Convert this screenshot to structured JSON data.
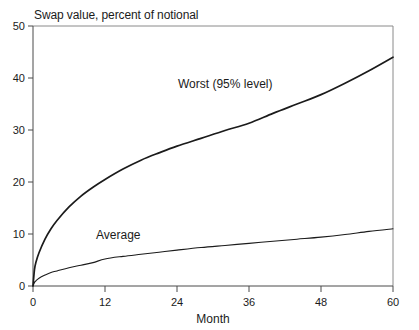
{
  "chart_data": {
    "type": "line",
    "title": "Swap value, percent of notional",
    "xlabel": "Month",
    "ylabel": "",
    "xlim": [
      0,
      60
    ],
    "ylim": [
      0,
      50
    ],
    "grid": false,
    "legend_position": "inline-annotations",
    "xticks": [
      "0",
      "12",
      "24",
      "36",
      "48",
      "60"
    ],
    "xtick_values": [
      0,
      12,
      24,
      36,
      48,
      60
    ],
    "yticks": [
      "0",
      "10",
      "20",
      "30",
      "40",
      "50"
    ],
    "ytick_values": [
      0,
      10,
      20,
      30,
      40,
      50
    ],
    "x": [
      0,
      0.25,
      0.5,
      1,
      2,
      3,
      4,
      6,
      8,
      10,
      12,
      15,
      18,
      21,
      24,
      28,
      32,
      36,
      40,
      44,
      48,
      52,
      56,
      60
    ],
    "series": [
      {
        "name": "Worst (95% level)",
        "label": "Worst (95% level)",
        "color": "#1b1b1b",
        "values": [
          0,
          3.2,
          4.6,
          6.4,
          9.0,
          11.0,
          12.6,
          15.2,
          17.3,
          19.0,
          20.5,
          22.5,
          24.2,
          25.6,
          26.9,
          28.4,
          29.9,
          31.3,
          33.2,
          35.0,
          36.8,
          39.0,
          41.4,
          44.0
        ]
      },
      {
        "name": "Average",
        "label": "Average",
        "color": "#1b1b1b",
        "values": [
          0,
          0.7,
          1.0,
          1.5,
          2.1,
          2.6,
          2.9,
          3.5,
          4.0,
          4.5,
          5.2,
          5.7,
          6.1,
          6.5,
          6.9,
          7.4,
          7.8,
          8.2,
          8.6,
          9.0,
          9.4,
          9.9,
          10.5,
          11.0
        ]
      }
    ],
    "annotations": [
      {
        "text": "Worst (95% level)",
        "x_px": 178,
        "y_px": 88
      },
      {
        "text": "Average",
        "x_px": 96,
        "y_px": 239
      }
    ]
  }
}
